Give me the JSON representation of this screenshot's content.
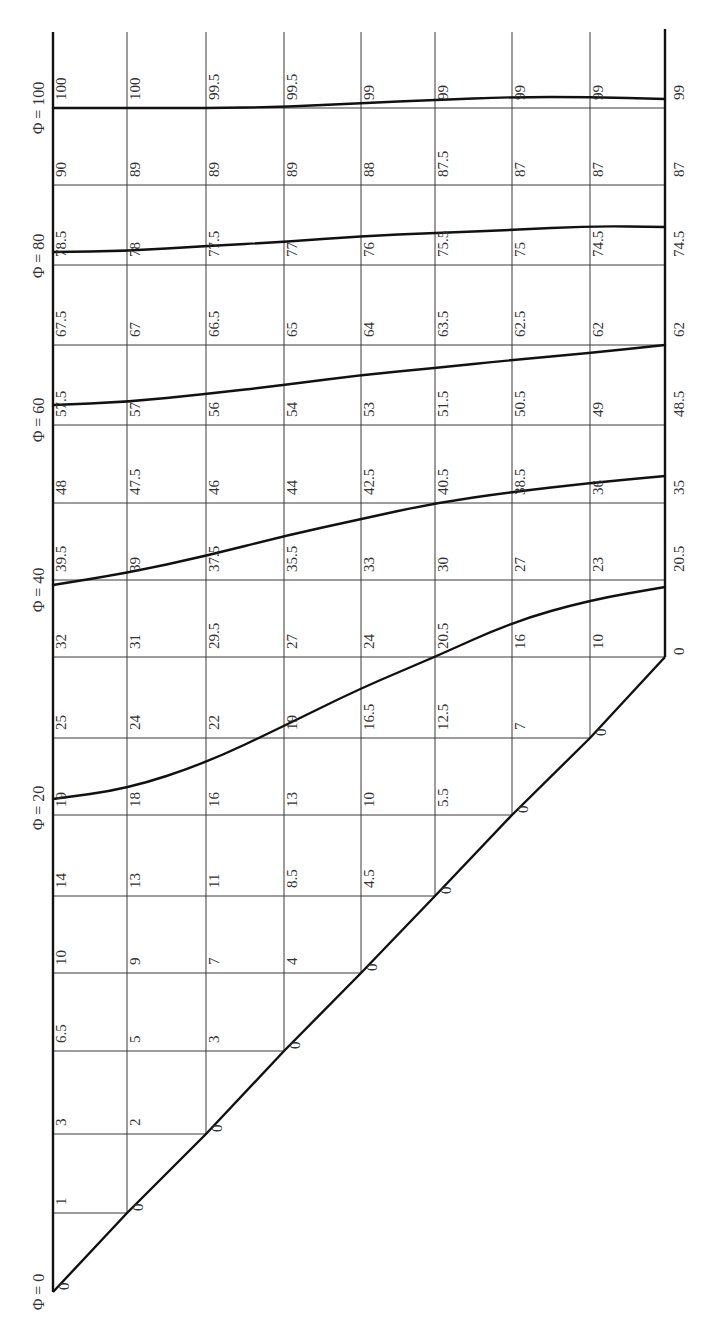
{
  "title": "Φ contour grid",
  "phi_labels": [
    "Φ = 0",
    "Φ = 20",
    "Φ = 40",
    "Φ = 60",
    "Φ = 80",
    "Φ = 100"
  ],
  "colors": {
    "lines": "#3a3a3a",
    "frame": "#111111",
    "text": "#333333",
    "background": "#ffffff"
  },
  "grid": {
    "rows": [
      [
        "100",
        "100",
        "99.5",
        "99.5",
        "99",
        "99",
        "99",
        "99",
        "99"
      ],
      [
        "90",
        "89",
        "89",
        "89",
        "88",
        "87.5",
        "87",
        "87",
        "87"
      ],
      [
        "78.5",
        "78",
        "77.5",
        "77",
        "76",
        "75.5",
        "75",
        "74.5",
        "74.5"
      ],
      [
        "67.5",
        "67",
        "66.5",
        "65",
        "64",
        "63.5",
        "62.5",
        "62",
        "62"
      ],
      [
        "57.5",
        "57",
        "56",
        "54",
        "53",
        "51.5",
        "50.5",
        "49",
        "48.5"
      ],
      [
        "48",
        "47.5",
        "46",
        "44",
        "42.5",
        "40.5",
        "38.5",
        "36",
        "35"
      ],
      [
        "39.5",
        "39",
        "37.5",
        "35.5",
        "33",
        "30",
        "27",
        "23",
        "20.5"
      ],
      [
        "32",
        "31",
        "29.5",
        "27",
        "24",
        "20.5",
        "16",
        "10",
        "0"
      ],
      [
        "25",
        "24",
        "22",
        "19",
        "16.5",
        "12.5",
        "7",
        "0"
      ],
      [
        "19",
        "18",
        "16",
        "13",
        "10",
        "5.5",
        "0"
      ],
      [
        "14",
        "13",
        "11",
        "8.5",
        "4.5",
        "0"
      ],
      [
        "10",
        "9",
        "7",
        "4",
        "0"
      ],
      [
        "6.5",
        "5",
        "3",
        "0"
      ],
      [
        "3",
        "2",
        "0"
      ],
      [
        "1",
        "0"
      ],
      [
        "0"
      ]
    ]
  },
  "chart_data": {
    "type": "contour-grid",
    "title": "",
    "contours": [
      0,
      20,
      40,
      60,
      80,
      100
    ],
    "row_values": [
      [
        100,
        100,
        99.5,
        99.5,
        99,
        99,
        99,
        99,
        99
      ],
      [
        90,
        89,
        89,
        89,
        88,
        87.5,
        87,
        87,
        87
      ],
      [
        78.5,
        78,
        77.5,
        77,
        76,
        75.5,
        75,
        74.5,
        74.5
      ],
      [
        67.5,
        67,
        66.5,
        65,
        64,
        63.5,
        62.5,
        62,
        62
      ],
      [
        57.5,
        57,
        56,
        54,
        53,
        51.5,
        50.5,
        49,
        48.5
      ],
      [
        48,
        47.5,
        46,
        44,
        42.5,
        40.5,
        38.5,
        36,
        35
      ],
      [
        39.5,
        39,
        37.5,
        35.5,
        33,
        30,
        27,
        23,
        20.5
      ],
      [
        32,
        31,
        29.5,
        27,
        24,
        20.5,
        16,
        10,
        0
      ],
      [
        25,
        24,
        22,
        19,
        16.5,
        12.5,
        7,
        0
      ],
      [
        19,
        18,
        16,
        13,
        10,
        5.5,
        0
      ],
      [
        14,
        13,
        11,
        8.5,
        4.5,
        0
      ],
      [
        10,
        9,
        7,
        4,
        0
      ],
      [
        6.5,
        5,
        3,
        0
      ],
      [
        3,
        2,
        0
      ],
      [
        1,
        0
      ],
      [
        0
      ]
    ]
  }
}
